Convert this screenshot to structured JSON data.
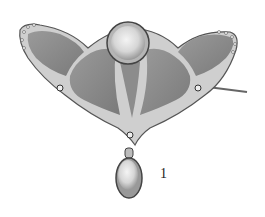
{
  "image": {
    "subject": "Art Nouveau brooch with moonstone cabochons and enamel panels",
    "colors": {
      "metal": "#c8c8c8",
      "enamel": "#8a8a8a",
      "stone": "#e8e8e8",
      "background": "#ffffff"
    }
  },
  "caption": {
    "label": "1"
  }
}
